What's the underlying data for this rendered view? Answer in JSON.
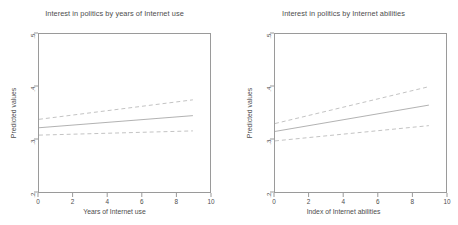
{
  "figure": {
    "background_color": "#ffffff",
    "line_color": "#b9b9b9",
    "fit_line_color": "#b0b0b0",
    "axis_color": "#9a9a9a",
    "text_color": "#4d4d4d"
  },
  "chart_data": [
    {
      "type": "line",
      "panel": "left",
      "title": "Interest in politics by years of Internet use",
      "xlabel": "Years of Internet use",
      "ylabel": "Predicted values",
      "xlim": [
        0,
        10
      ],
      "ylim": [
        0.2,
        0.5
      ],
      "xticks": [
        0,
        2,
        4,
        6,
        8,
        10
      ],
      "xticklabels": [
        "0",
        "2",
        "4",
        "6",
        "8",
        "10"
      ],
      "yticks": [
        0.2,
        0.3,
        0.4,
        0.5
      ],
      "yticklabels": [
        ".2",
        ".3",
        ".4",
        ".5"
      ],
      "grid": false,
      "legend": "none",
      "x": [
        0,
        9
      ],
      "series": [
        {
          "name": "Predicted values (fit)",
          "style": "solid",
          "values": [
            0.322,
            0.345
          ]
        },
        {
          "name": "Upper 95% confidence limit",
          "style": "dashed",
          "values": [
            0.338,
            0.375
          ]
        },
        {
          "name": "Lower 95% confidence limit",
          "style": "dashed",
          "values": [
            0.308,
            0.316
          ]
        }
      ]
    },
    {
      "type": "line",
      "panel": "right",
      "title": "Interest in politics by Internet abilities",
      "xlabel": "Index of Internet abilities",
      "ylabel": "Predicted values",
      "xlim": [
        0,
        10
      ],
      "ylim": [
        0.2,
        0.5
      ],
      "xticks": [
        0,
        2,
        4,
        6,
        8,
        10
      ],
      "xticklabels": [
        "0",
        "2",
        "4",
        "6",
        "8",
        "10"
      ],
      "yticks": [
        0.2,
        0.3,
        0.4,
        0.5
      ],
      "yticklabels": [
        ".2",
        ".3",
        ".4",
        ".5"
      ],
      "grid": false,
      "legend": "none",
      "x": [
        0,
        9
      ],
      "series": [
        {
          "name": "Predicted values (fit)",
          "style": "solid",
          "values": [
            0.315,
            0.365
          ]
        },
        {
          "name": "Upper 95% confidence limit",
          "style": "dashed",
          "values": [
            0.33,
            0.4
          ]
        },
        {
          "name": "Lower 95% confidence limit",
          "style": "dashed",
          "values": [
            0.297,
            0.326
          ]
        }
      ]
    }
  ]
}
